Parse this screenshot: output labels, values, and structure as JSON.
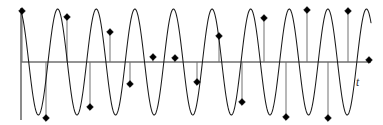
{
  "figure": {
    "background_color": "#ffffff",
    "width": 383,
    "height": 125
  },
  "axes": {
    "x_axis": {
      "label": "t",
      "label_x": 356,
      "label_y": 86,
      "y_position": 62,
      "x_start": 21,
      "x_end": 371,
      "color": "#6f6f6f"
    },
    "y_axis": {
      "label": "",
      "x_position": 21,
      "y_start": 8,
      "y_end": 120,
      "color": "#6f6f6f"
    }
  },
  "styles": {
    "wave_color": "#1a1a1a",
    "wave_width": 1.05,
    "stem_color": "#8d8d8d",
    "stem_width": 1.25,
    "dot_color": "#000000",
    "dot_radius": 3.4
  },
  "chart_data": {
    "type": "line",
    "xlabel": "t",
    "ylabel": "",
    "grid": false,
    "legend": null,
    "xlim": [
      0,
      383
    ],
    "ylim": [
      -1.08,
      1.08
    ],
    "baseline_y": 62,
    "amplitude_px": 53,
    "series": [
      {
        "name": "continuous-sine",
        "kind": "continuous",
        "cycles": 9.05,
        "period_px": 38.6,
        "phase_deg": 108,
        "x_start": 21,
        "x_end": 371,
        "amplitude": 1.0,
        "samples_per_px": 1
      },
      {
        "name": "sample-points",
        "kind": "markers",
        "marker": "diamond",
        "count": 17,
        "points": [
          {
            "x": 22,
            "y": 11,
            "value": 0.96
          },
          {
            "x": 46,
            "y": 118,
            "value": -1.0
          },
          {
            "x": 67,
            "y": 17,
            "value": 0.85
          },
          {
            "x": 90,
            "y": 107,
            "value": -0.85
          },
          {
            "x": 110,
            "y": 32,
            "value": 0.57
          },
          {
            "x": 130,
            "y": 84,
            "value": -0.42
          },
          {
            "x": 153,
            "y": 57,
            "value": 0.09
          },
          {
            "x": 175,
            "y": 58,
            "value": 0.08
          },
          {
            "x": 197,
            "y": 82,
            "value": -0.38
          },
          {
            "x": 219,
            "y": 36,
            "value": 0.49
          },
          {
            "x": 242,
            "y": 102,
            "value": -0.75
          },
          {
            "x": 264,
            "y": 18,
            "value": 0.83
          },
          {
            "x": 286,
            "y": 117,
            "value": -1.0
          },
          {
            "x": 307,
            "y": 10,
            "value": 0.98
          },
          {
            "x": 328,
            "y": 118,
            "value": -1.0
          },
          {
            "x": 348,
            "y": 11,
            "value": 0.96
          },
          {
            "x": 369,
            "y": 60,
            "value": 0.04
          }
        ]
      }
    ]
  }
}
